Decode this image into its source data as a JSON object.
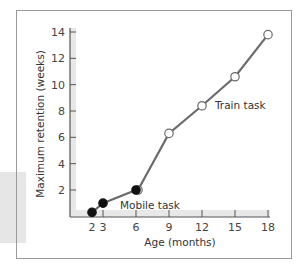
{
  "chart_data": {
    "type": "line",
    "title": "",
    "xlabel": "Age (months)",
    "ylabel": "Maximum retention (weeks)",
    "xlim": [
      0,
      18
    ],
    "ylim": [
      0,
      14
    ],
    "x_ticks": [
      2,
      3,
      6,
      9,
      12,
      15,
      18
    ],
    "y_ticks": [
      2,
      4,
      6,
      8,
      10,
      12,
      14
    ],
    "grid": false,
    "legend": "inline labels",
    "series": [
      {
        "name": "Mobile task",
        "marker": "filled-circle",
        "x": [
          2,
          3,
          6
        ],
        "values": [
          0.3,
          1.0,
          2.0
        ]
      },
      {
        "name": "Train task",
        "marker": "open-circle",
        "x": [
          6,
          9,
          12,
          15,
          18
        ],
        "values": [
          2.0,
          6.3,
          8.4,
          10.6,
          13.8
        ]
      }
    ],
    "colors": {
      "line": "#6b6b6b",
      "axis": "#555555",
      "band": "#e8e8e8",
      "filled_marker": "#111111",
      "open_marker_fill": "#ffffff"
    }
  }
}
